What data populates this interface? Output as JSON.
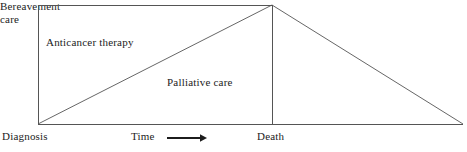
{
  "diagram": {
    "type": "palliative-care-continuum",
    "regions": [
      {
        "id": "anticancer",
        "label": "Anticancer therapy"
      },
      {
        "id": "palliative",
        "label": "Palliative care"
      },
      {
        "id": "bereavement",
        "label_line1": "Bereavement",
        "label_line2": "care"
      }
    ],
    "axis": {
      "start_label": "Diagnosis",
      "time_label": "Time",
      "end_label": "Death",
      "arrow": "right-arrow-icon"
    },
    "colors": {
      "line": "#555555",
      "text": "#1c1c1c",
      "background": "#ffffff"
    },
    "geometry": {
      "left_x": 38,
      "apex_x": 272,
      "right_x": 463,
      "top_y": 5,
      "baseline_y": 124,
      "arrow_start_x": 167,
      "arrow_end_x": 205,
      "arrow_y": 138
    }
  }
}
